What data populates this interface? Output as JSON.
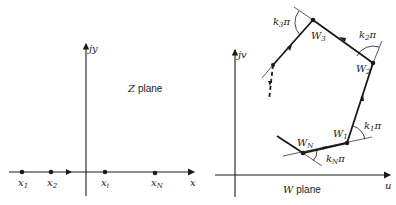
{
  "z_plane": {
    "title_var": "Z",
    "title_word": "plane",
    "x_axis_label": "x",
    "y_axis_label": "jy",
    "points": [
      {
        "name": "x1",
        "base": "x",
        "sub": "1"
      },
      {
        "name": "x2",
        "base": "x",
        "sub": "2"
      },
      {
        "name": "xi",
        "base": "x",
        "sub": "i"
      },
      {
        "name": "xN",
        "base": "x",
        "sub": "N"
      }
    ]
  },
  "w_plane": {
    "title_var": "W",
    "title_word": "plane",
    "u_axis_label": "u",
    "v_axis_label": "jv",
    "vertices": [
      {
        "name": "W1",
        "base": "W",
        "sub": "1"
      },
      {
        "name": "W2",
        "base": "W",
        "sub": "2"
      },
      {
        "name": "W3",
        "base": "W",
        "sub": "3"
      },
      {
        "name": "WN",
        "base": "W",
        "sub": "N"
      }
    ],
    "angles": [
      {
        "name": "k1pi",
        "base": "k",
        "sub": "1",
        "pi": "π"
      },
      {
        "name": "k2pi",
        "base": "k",
        "sub": "2",
        "pi": "π"
      },
      {
        "name": "k3pi",
        "base": "k",
        "sub": "3",
        "pi": "π"
      },
      {
        "name": "kNpi",
        "base": "k",
        "sub": "N",
        "pi": "π"
      }
    ]
  }
}
